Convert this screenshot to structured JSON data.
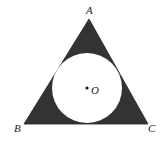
{
  "diagram": {
    "colors": {
      "fill": "#333333",
      "circle": "#ffffff",
      "text": "#222222"
    },
    "vertices": [
      {
        "label": "A",
        "x": 89,
        "y": 19
      },
      {
        "label": "B",
        "x": 24,
        "y": 124
      },
      {
        "label": "C",
        "x": 148,
        "y": 124
      }
    ],
    "center": {
      "label": "O",
      "x": 87,
      "y": 88
    },
    "circle_radius": 35
  }
}
